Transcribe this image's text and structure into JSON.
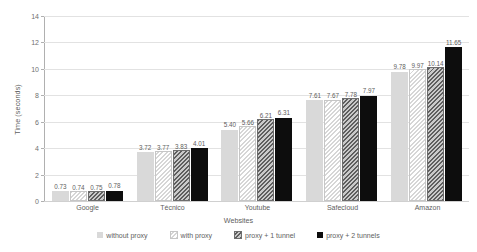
{
  "chart_data": {
    "type": "bar",
    "title": "",
    "xlabel": "Websites",
    "ylabel": "Time (seconds)",
    "categories": [
      "Google",
      "Técnico",
      "Youtube",
      "Safecloud",
      "Amazon"
    ],
    "ylim": [
      0,
      14
    ],
    "yticks": [
      0,
      2,
      4,
      6,
      8,
      10,
      12,
      14
    ],
    "grid": true,
    "legend_position": "bottom",
    "series": [
      {
        "name": "without proxy",
        "color": "#d9d9d9",
        "pattern": "solid",
        "values": [
          0.73,
          3.72,
          5.4,
          7.61,
          9.78
        ],
        "labels": [
          "0.73",
          "3.72",
          "5.40",
          "7.61",
          "9.78"
        ]
      },
      {
        "name": "with proxy",
        "color": "#d6d6d6",
        "pattern": "diagonal-hatch-light",
        "values": [
          0.74,
          3.77,
          5.66,
          7.67,
          9.97
        ],
        "labels": [
          "0.74",
          "3.77",
          "5.66",
          "7.67",
          "9.97"
        ]
      },
      {
        "name": "proxy + 1 tunnel",
        "color": "#5e5e5e",
        "pattern": "diagonal-hatch-dark",
        "values": [
          0.75,
          3.83,
          6.21,
          7.78,
          10.14
        ],
        "labels": [
          "0.75",
          "3.83",
          "6.21",
          "7.78",
          "10.14"
        ]
      },
      {
        "name": "proxy + 2 tunnels",
        "color": "#0d0d0d",
        "pattern": "solid",
        "values": [
          0.78,
          4.01,
          6.31,
          7.97,
          11.65
        ],
        "labels": [
          "0.78",
          "4.01",
          "6.31",
          "7.97",
          "11.65"
        ]
      }
    ]
  }
}
